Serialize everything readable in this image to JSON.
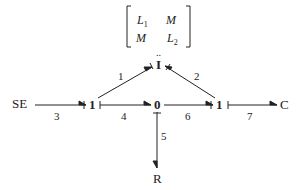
{
  "diagram": {
    "type": "bond-graph",
    "matrix": {
      "r1c1": "L",
      "r1c1_sub": "1",
      "r1c2": "M",
      "r2c1": "M",
      "r2c2": "L",
      "r2c2_sub": "2"
    },
    "inertia_dots": "..",
    "nodes": {
      "inertia": "I",
      "source": "SE",
      "junction_left": "1",
      "junction_center": "0",
      "junction_right": "1",
      "capacitor": "C",
      "resistor": "R"
    },
    "bonds": {
      "b1": "1",
      "b2": "2",
      "b3": "3",
      "b4": "4",
      "b5": "5",
      "b6": "6",
      "b7": "7"
    },
    "colors": {
      "ink": "#222222",
      "background": "#ffffff"
    }
  }
}
